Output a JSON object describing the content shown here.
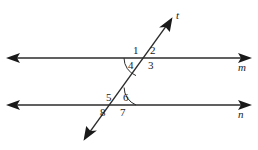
{
  "figure": {
    "background_color": "#ffffff",
    "stroke_color": "#2b2b2b",
    "width": 258,
    "height": 150
  },
  "lines": [
    {
      "id": "line-m",
      "label": "m",
      "kind": "horizontal-double-arrow",
      "label_x": 238,
      "label_y": 62,
      "y": 58,
      "x_start": 8,
      "x_end": 250
    },
    {
      "id": "line-n",
      "label": "n",
      "kind": "horizontal-double-arrow",
      "label_x": 238,
      "label_y": 109,
      "y": 105,
      "x_start": 8,
      "x_end": 250
    },
    {
      "id": "line-t",
      "label": "t",
      "kind": "transversal-double-arrow",
      "label_x": 176,
      "label_y": 10,
      "x_start": 84,
      "y_start": 140,
      "x_end": 172,
      "y_end": 18
    }
  ],
  "intersections": [
    {
      "id": "upper-intersection",
      "x": 143,
      "y": 58,
      "on_line": "m"
    },
    {
      "id": "lower-intersection",
      "x": 117,
      "y": 105,
      "on_line": "n"
    }
  ],
  "angle_labels": [
    {
      "id": "angle-1",
      "text": "1",
      "x": 133,
      "y": 45,
      "position": "upper-left"
    },
    {
      "id": "angle-2",
      "text": "2",
      "x": 150,
      "y": 45,
      "position": "upper-right"
    },
    {
      "id": "angle-3",
      "text": "3",
      "x": 148,
      "y": 60,
      "position": "lower-right"
    },
    {
      "id": "angle-4",
      "text": "4",
      "x": 128,
      "y": 60,
      "position": "lower-left"
    },
    {
      "id": "angle-5",
      "text": "5",
      "x": 106,
      "y": 92,
      "position": "upper-left"
    },
    {
      "id": "angle-6",
      "text": "6",
      "x": 123,
      "y": 92,
      "position": "upper-right"
    },
    {
      "id": "angle-7",
      "text": "7",
      "x": 120,
      "y": 107,
      "position": "lower-right"
    },
    {
      "id": "angle-8",
      "text": "8",
      "x": 100,
      "y": 107,
      "position": "lower-left"
    }
  ],
  "angle_arcs": [
    {
      "id": "arc-angle-4",
      "at": "upper-intersection",
      "marks": "4"
    },
    {
      "id": "arc-angle-6",
      "at": "lower-intersection",
      "marks": "6"
    }
  ]
}
